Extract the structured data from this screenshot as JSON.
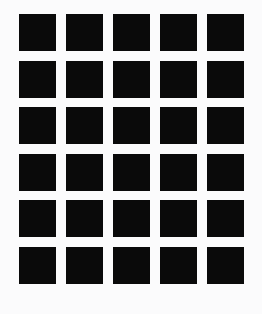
{
  "canvas": {
    "width": 262,
    "height": 314,
    "background_color": "#fbfbfc",
    "description": "black-square-grid-pattern"
  },
  "pattern": {
    "name": "square-grid",
    "columns": 5,
    "rows": 6,
    "total_cells": 30,
    "cell_color": "#0a0a0a",
    "cell_width": 37,
    "cell_height": 37,
    "column_pitch": 47,
    "row_pitch": 46.5,
    "column_gap": 10,
    "row_gap": 9.5,
    "origin_x": 19,
    "origin_y": 14,
    "grid_width": 225,
    "grid_height": 282,
    "cells": [
      {
        "row": 1,
        "col": 1,
        "color": "#0a0a0a"
      },
      {
        "row": 1,
        "col": 2,
        "color": "#0a0a0a"
      },
      {
        "row": 1,
        "col": 3,
        "color": "#0a0a0a"
      },
      {
        "row": 1,
        "col": 4,
        "color": "#0a0a0a"
      },
      {
        "row": 1,
        "col": 5,
        "color": "#0a0a0a"
      },
      {
        "row": 2,
        "col": 1,
        "color": "#0a0a0a"
      },
      {
        "row": 2,
        "col": 2,
        "color": "#0a0a0a"
      },
      {
        "row": 2,
        "col": 3,
        "color": "#0a0a0a"
      },
      {
        "row": 2,
        "col": 4,
        "color": "#0a0a0a"
      },
      {
        "row": 2,
        "col": 5,
        "color": "#0a0a0a"
      },
      {
        "row": 3,
        "col": 1,
        "color": "#0a0a0a"
      },
      {
        "row": 3,
        "col": 2,
        "color": "#0a0a0a"
      },
      {
        "row": 3,
        "col": 3,
        "color": "#0a0a0a"
      },
      {
        "row": 3,
        "col": 4,
        "color": "#0a0a0a"
      },
      {
        "row": 3,
        "col": 5,
        "color": "#0a0a0a"
      },
      {
        "row": 4,
        "col": 1,
        "color": "#0a0a0a"
      },
      {
        "row": 4,
        "col": 2,
        "color": "#0a0a0a"
      },
      {
        "row": 4,
        "col": 3,
        "color": "#0a0a0a"
      },
      {
        "row": 4,
        "col": 4,
        "color": "#0a0a0a"
      },
      {
        "row": 4,
        "col": 5,
        "color": "#0a0a0a"
      },
      {
        "row": 5,
        "col": 1,
        "color": "#0a0a0a"
      },
      {
        "row": 5,
        "col": 2,
        "color": "#0a0a0a"
      },
      {
        "row": 5,
        "col": 3,
        "color": "#0a0a0a"
      },
      {
        "row": 5,
        "col": 4,
        "color": "#0a0a0a"
      },
      {
        "row": 5,
        "col": 5,
        "color": "#0a0a0a"
      },
      {
        "row": 6,
        "col": 1,
        "color": "#0a0a0a"
      },
      {
        "row": 6,
        "col": 2,
        "color": "#0a0a0a"
      },
      {
        "row": 6,
        "col": 3,
        "color": "#0a0a0a"
      },
      {
        "row": 6,
        "col": 4,
        "color": "#0a0a0a"
      },
      {
        "row": 6,
        "col": 5,
        "color": "#0a0a0a"
      }
    ]
  }
}
